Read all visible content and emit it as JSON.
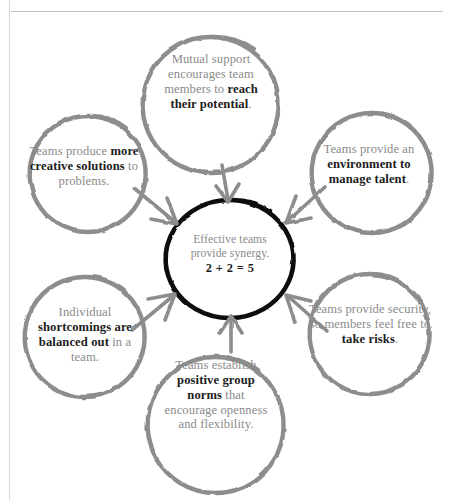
{
  "page": {
    "background_color": "#ffffff",
    "rule_color": "#bfbfbf",
    "left_margin_rule_color": "#d8d8d8"
  },
  "style": {
    "outer_circle_color": "#8d8d8d",
    "center_circle_color": "#111111",
    "arrow_color": "#8d8d8d",
    "body_text_color": "#8a8a8a",
    "emphasis_text_color": "#1c1c1c"
  },
  "diagram": {
    "type": "hub-and-spoke",
    "center": {
      "id": "center",
      "line1": "Effective teams",
      "line2": "provide synergy.",
      "equation": "2 + 2 = 5",
      "plain_text": "Effective teams provide synergy. 2 + 2 = 5"
    },
    "nodes": [
      {
        "id": "top",
        "position": "top",
        "lead": "Mutual support encourages team members to ",
        "emphasis": "reach their potential",
        "tail": ".",
        "plain_text": "Mutual support encourages team members to reach their potential."
      },
      {
        "id": "upper-right",
        "position": "upper-right",
        "lead": "Teams provide an ",
        "emphasis": "environment to manage talent",
        "tail": ".",
        "plain_text": "Teams provide an environment to manage talent."
      },
      {
        "id": "lower-right",
        "position": "lower-right",
        "lead": "Teams provide security, so members feel free to ",
        "emphasis": "take risks",
        "tail": ".",
        "plain_text": "Teams provide security, so members feel free to take risks."
      },
      {
        "id": "bottom",
        "position": "bottom",
        "lead": "Teams establish ",
        "emphasis": "positive group norms",
        "tail": " that encourage openness and flexibility.",
        "plain_text": "Teams establish positive group norms that encourage openness and flexibility."
      },
      {
        "id": "lower-left",
        "position": "lower-left",
        "lead": "Individual ",
        "emphasis": "shortcomings are balanced out",
        "tail": " in a team.",
        "plain_text": "Individual shortcomings are balanced out in a team."
      },
      {
        "id": "upper-left",
        "position": "upper-left",
        "lead": "Teams produce ",
        "emphasis": "more creative solutions",
        "tail": " to problems.",
        "plain_text": "Teams produce more creative solutions to problems."
      }
    ],
    "arrows": [
      {
        "id": "arrow-top-to-center",
        "from": "top",
        "to": "center",
        "direction": "down"
      },
      {
        "id": "arrow-upper-left-to-center",
        "from": "upper-left",
        "to": "center",
        "direction": "down-right"
      },
      {
        "id": "arrow-upper-right-to-center",
        "from": "upper-right",
        "to": "center",
        "direction": "down-left"
      },
      {
        "id": "arrow-lower-left-to-center",
        "from": "lower-left",
        "to": "center",
        "direction": "up-right"
      },
      {
        "id": "arrow-lower-right-to-center",
        "from": "lower-right",
        "to": "center",
        "direction": "up-left"
      },
      {
        "id": "arrow-bottom-to-center",
        "from": "bottom",
        "to": "center",
        "direction": "up"
      }
    ]
  }
}
